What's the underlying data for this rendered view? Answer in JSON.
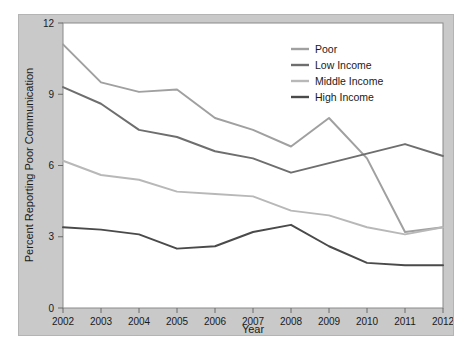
{
  "chart_data": {
    "type": "line",
    "title": "",
    "xlabel": "Year",
    "ylabel": "Percent Reporting Poor Communication",
    "x": [
      2002,
      2003,
      2004,
      2005,
      2006,
      2007,
      2008,
      2009,
      2010,
      2011,
      2012
    ],
    "xtick_labels": [
      "2002",
      "2003",
      "2004",
      "2005",
      "2006",
      "2007",
      "2008",
      "2009",
      "2010",
      "2011",
      "2012"
    ],
    "ytick_labels": [
      "0",
      "3",
      "6",
      "9",
      "12"
    ],
    "yticks": [
      0,
      3,
      6,
      9,
      12
    ],
    "ylim": [
      0,
      12
    ],
    "xlim": [
      2002,
      2012
    ],
    "grid": false,
    "legend_position": "top-right",
    "series": [
      {
        "name": "Poor",
        "color": "#a0a0a0",
        "values": [
          11.1,
          9.5,
          9.1,
          9.2,
          8.0,
          7.5,
          6.8,
          8.0,
          6.3,
          3.2,
          3.4
        ]
      },
      {
        "name": "Low Income",
        "color": "#6e6e6e",
        "values": [
          9.3,
          8.6,
          7.5,
          7.2,
          6.6,
          6.3,
          5.7,
          6.1,
          6.5,
          6.9,
          6.4
        ]
      },
      {
        "name": "Middle Income",
        "color": "#b8b8b8",
        "values": [
          6.2,
          5.6,
          5.4,
          4.9,
          4.8,
          4.7,
          4.1,
          3.9,
          3.4,
          3.1,
          3.4
        ]
      },
      {
        "name": "High Income",
        "color": "#4a4a4a",
        "values": [
          3.4,
          3.3,
          3.1,
          2.5,
          2.6,
          3.2,
          3.5,
          2.6,
          1.9,
          1.8,
          1.8
        ]
      }
    ]
  },
  "legend": {
    "items": [
      {
        "label": "Poor"
      },
      {
        "label": "Low Income"
      },
      {
        "label": "Middle Income"
      },
      {
        "label": "High Income"
      }
    ]
  },
  "axes": {
    "x_title": "Year",
    "y_title": "Percent Reporting Poor Communication"
  }
}
